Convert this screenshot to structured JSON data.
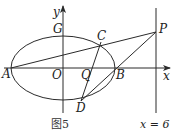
{
  "figure": {
    "caption": "图5",
    "line_label": "x = 6",
    "axes": {
      "x_label": "x",
      "y_label": "y"
    },
    "points": {
      "A": "A",
      "B": "B",
      "C": "C",
      "D": "D",
      "G": "G",
      "O": "O",
      "P": "P",
      "Q": "Q"
    },
    "elements": [
      "ellipse centered at O with vertices A, B on x-axis and G on y-axis",
      "vertical line x = 6 through P",
      "segment A-P through C",
      "segment C-D through Q",
      "segment D-P through B"
    ],
    "colors": {
      "stroke": "#2a2a2a",
      "background": "#ffffff"
    }
  }
}
